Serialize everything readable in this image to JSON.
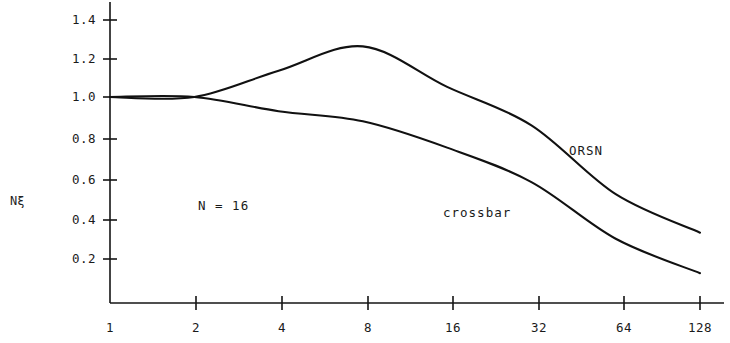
{
  "chart_data": {
    "type": "line",
    "title": "",
    "xlabel": "",
    "ylabel": "Nξ",
    "annotation": "N  =  16",
    "x_scale": "log2",
    "x_ticks": [
      "1",
      "2",
      "4",
      "8",
      "16",
      "32",
      "64",
      "128"
    ],
    "x_tick_values": [
      1,
      2,
      4,
      8,
      16,
      32,
      64,
      128
    ],
    "y_ticks": [
      "0.2",
      "0.4",
      "0.6",
      "0.8",
      "1.0",
      "1.2",
      "1.4"
    ],
    "y_tick_values": [
      0.2,
      0.4,
      0.6,
      0.8,
      1.0,
      1.2,
      1.4
    ],
    "ylim": [
      0,
      1.5
    ],
    "xlim": [
      1,
      128
    ],
    "grid": false,
    "legend": "inline-labels",
    "line_color": "#111111",
    "series": [
      {
        "name": "ORSN",
        "label": "ORSN",
        "x": [
          1,
          2,
          4,
          8,
          16,
          32,
          64,
          128
        ],
        "values": [
          1.0,
          1.0,
          1.13,
          1.25,
          1.05,
          0.86,
          0.52,
          0.33
        ]
      },
      {
        "name": "crossbar",
        "label": "crossbar",
        "x": [
          1,
          2,
          4,
          8,
          16,
          32,
          64,
          128
        ],
        "values": [
          1.0,
          1.0,
          0.93,
          0.88,
          0.75,
          0.58,
          0.3,
          0.13
        ]
      }
    ]
  },
  "axis": {
    "y_label": "Nξ"
  },
  "labels": {
    "orsn": "ORSN",
    "crossbar": "crossbar",
    "n_equals": "N  =  16"
  },
  "y_tick_labels": [
    "1.4",
    "1.2",
    "1.0",
    "0.8",
    "0.6",
    "0.4",
    "0.2"
  ],
  "x_tick_labels": [
    "1",
    "2",
    "4",
    "8",
    "16",
    "32",
    "64",
    "128"
  ]
}
